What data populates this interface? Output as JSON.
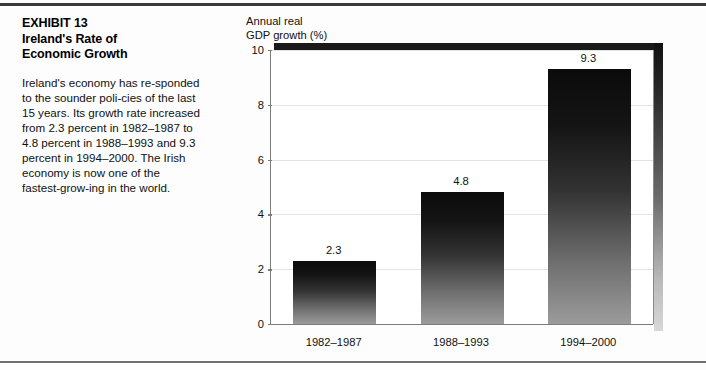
{
  "exhibit": {
    "title_lines": "EXHIBIT 13\nIreland's Rate of\nEconomic Growth",
    "body": "Ireland's economy has re-sponded to the sounder poli-cies of the last 15 years. Its growth rate increased from 2.3 percent in 1982–1987 to 4.8 percent in 1988–1993 and 9.3 percent in 1994–2000. The Irish economy is now one of the fastest-grow-ing in the world."
  },
  "chart_data": {
    "type": "bar",
    "title": "",
    "axis_title": "Annual real\nGDP growth (%)",
    "categories": [
      "1982–1987",
      "1988–1993",
      "1994–2000"
    ],
    "values": [
      2.3,
      4.8,
      9.3
    ],
    "value_labels": [
      "2.3",
      "4.8",
      "9.3"
    ],
    "xlabel": "",
    "ylabel": "Annual real GDP growth (%)",
    "ylim": [
      0,
      10
    ],
    "yticks": [
      0,
      2,
      4,
      6,
      8,
      10
    ],
    "ytick_labels": [
      "0",
      "2",
      "4",
      "6",
      "8",
      "10"
    ],
    "grid": true,
    "legend": "none",
    "bar_color_top": "#0b0b0b",
    "bar_color_bottom": "#9b9b9b"
  }
}
